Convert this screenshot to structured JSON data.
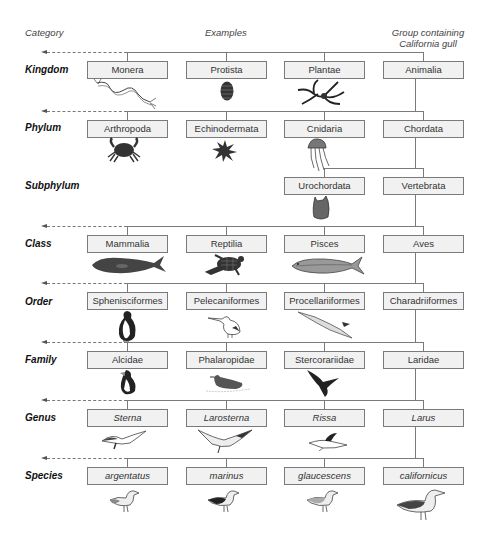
{
  "headers": {
    "category": "Category",
    "examples": "Examples",
    "group_line1": "Group containing",
    "group_line2": "California gull"
  },
  "ranks": [
    {
      "name": "Kingdom",
      "boxes": [
        "Monera",
        "Protista",
        "Plantae",
        "Animalia"
      ],
      "icons": [
        "bacterium-icon",
        "protist-icon",
        "plant-icon",
        ""
      ]
    },
    {
      "name": "Phylum",
      "boxes": [
        "Arthropoda",
        "Echinodermata",
        "Cnidaria",
        "Chordata"
      ],
      "icons": [
        "crab-icon",
        "sea-urchin-icon",
        "jellyfish-icon",
        ""
      ]
    },
    {
      "name": "Subphylum",
      "boxes": [
        "",
        "",
        "Urochordata",
        "Vertebrata"
      ],
      "icons": [
        "",
        "",
        "sea-squirt-icon",
        ""
      ]
    },
    {
      "name": "Class",
      "boxes": [
        "Mammalia",
        "Reptilia",
        "Pisces",
        "Aves"
      ],
      "icons": [
        "whale-icon",
        "sea-turtle-icon",
        "fish-icon",
        ""
      ]
    },
    {
      "name": "Order",
      "boxes": [
        "Sphenisciformes",
        "Pelecaniformes",
        "Procellariiformes",
        "Charadriiformes"
      ],
      "icons": [
        "penguin-icon",
        "pelican-icon",
        "albatross-icon",
        ""
      ]
    },
    {
      "name": "Family",
      "boxes": [
        "Alcidae",
        "Phalaropidae",
        "Stercorariidae",
        "Laridae"
      ],
      "icons": [
        "puffin-icon",
        "phalarope-icon",
        "skua-icon",
        ""
      ]
    },
    {
      "name": "Genus",
      "boxes": [
        "Sterna",
        "Larosterna",
        "Rissa",
        "Larus"
      ],
      "icons": [
        "tern-icon",
        "inca-tern-icon",
        "kittiwake-icon",
        ""
      ]
    },
    {
      "name": "Species",
      "boxes": [
        "argentatus",
        "marinus",
        "glaucescens",
        "californicus"
      ],
      "icons": [
        "herring-gull-icon",
        "black-backed-gull-icon",
        "glaucous-winged-gull-icon",
        "california-gull-icon"
      ]
    }
  ],
  "colors": {
    "box_fill": "#f1f1f1",
    "box_border": "#7a7a7a",
    "line": "#7a7a7a"
  }
}
